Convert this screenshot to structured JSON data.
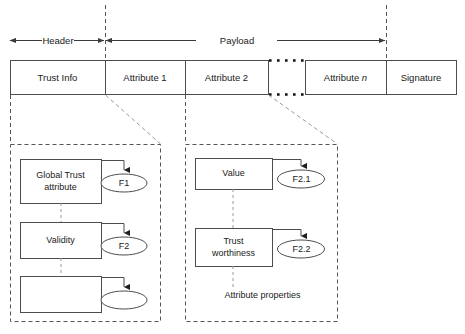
{
  "figure": {
    "colors": {
      "stroke": "#4d4d4d",
      "text": "#1a1a1a",
      "dashed": "#555555",
      "faint_dashed": "#9a9a9a",
      "background": "#ffffff"
    }
  },
  "spans": [
    {
      "id": "header",
      "label": "Header"
    },
    {
      "id": "payload",
      "label": "Payload"
    }
  ],
  "packet": {
    "cells": [
      {
        "id": "trust-info",
        "label": "Trust Info",
        "italic_tail": ""
      },
      {
        "id": "attribute-1",
        "label": "Attribute 1",
        "italic_tail": ""
      },
      {
        "id": "attribute-2",
        "label": "Attribute 2",
        "italic_tail": ""
      },
      {
        "id": "attribute-n",
        "label": "Attribute ",
        "italic_tail": "n"
      },
      {
        "id": "signature",
        "label": "Signature",
        "italic_tail": ""
      }
    ],
    "gap_marker": "dotted-ellipsis"
  },
  "detail_left": {
    "id": "trust-info-detail",
    "nodes": [
      {
        "id": "global-trust-attribute",
        "line1": "Global Trust",
        "line2": "attribute"
      },
      {
        "id": "validity",
        "line1": "Validity",
        "line2": ""
      },
      {
        "id": "empty-node",
        "line1": "",
        "line2": ""
      }
    ],
    "ellipses": [
      {
        "id": "f1",
        "label": "F1"
      },
      {
        "id": "f2",
        "label": "F2"
      },
      {
        "id": "f-empty",
        "label": ""
      }
    ]
  },
  "detail_right": {
    "id": "attribute-2-detail",
    "caption": "Attribute properties",
    "nodes": [
      {
        "id": "value",
        "line1": "Value",
        "line2": ""
      },
      {
        "id": "trust-worthiness",
        "line1": "Trust",
        "line2": "worthiness"
      }
    ],
    "ellipses": [
      {
        "id": "f2-1",
        "label": "F2.1"
      },
      {
        "id": "f2-2",
        "label": "F2.2"
      }
    ]
  }
}
